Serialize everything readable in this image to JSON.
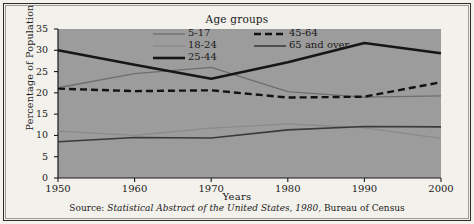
{
  "figure": {
    "background": "#f3f1ec",
    "plot_background": "#9c9c9c",
    "border_color": "#2b2b2b"
  },
  "chart_data": {
    "type": "line",
    "title": "Age groups",
    "xlabel": "Years",
    "ylabel": "Percentage of Population",
    "xlim": [
      1950,
      2000
    ],
    "ylim": [
      0,
      35
    ],
    "ytick_labels": [
      "0",
      "5",
      "10",
      "15",
      "20",
      "25",
      "30",
      "35"
    ],
    "ytick_values": [
      0,
      5,
      10,
      15,
      20,
      25,
      30,
      35
    ],
    "xtick_labels": [
      "1950",
      "1960",
      "1970",
      "1980",
      "1990",
      "2000"
    ],
    "x": [
      1950,
      1960,
      1970,
      1980,
      1990,
      2000
    ],
    "grid": false,
    "legend_position": "top-center-inside",
    "series": [
      {
        "name": "5-17",
        "values": [
          21.2,
          24.5,
          26.0,
          20.3,
          19.0,
          19.3
        ],
        "color": "#6e6e6e",
        "width": 1.3,
        "dash": "none"
      },
      {
        "name": "18-24",
        "values": [
          11.0,
          10.0,
          11.7,
          12.7,
          11.8,
          9.3
        ],
        "color": "#8a8a8a",
        "width": 1.3,
        "dash": "none"
      },
      {
        "name": "25-44",
        "values": [
          30.0,
          26.6,
          23.3,
          27.2,
          31.7,
          29.3
        ],
        "color": "#161616",
        "width": 2.6,
        "dash": "none"
      },
      {
        "name": "45-64",
        "values": [
          21.0,
          20.4,
          20.6,
          18.9,
          19.1,
          22.5
        ],
        "color": "#121212",
        "width": 2.4,
        "dash": "7,4"
      },
      {
        "name": "65 and over",
        "values": [
          8.5,
          9.5,
          9.4,
          11.3,
          12.1,
          12.0
        ],
        "color": "#3a3a3a",
        "width": 1.6,
        "dash": "none"
      }
    ],
    "legend_entries": [
      {
        "label": "5-17",
        "series": "5-17"
      },
      {
        "label": "18-24",
        "series": "18-24"
      },
      {
        "label": "25-44",
        "series": "25-44"
      },
      {
        "label": "45-64",
        "series": "45-64"
      },
      {
        "label": "65 and over",
        "series": "65 and over"
      }
    ],
    "source_prefix": "Source:",
    "source_italic": "Statistical Abstract of the United States, 1980,",
    "source_suffix": "Bureau of Census"
  }
}
